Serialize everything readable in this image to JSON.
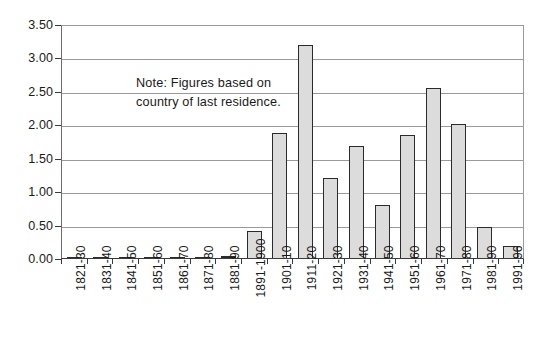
{
  "chart_data": {
    "type": "bar",
    "title": "",
    "subtitle": "",
    "xlabel": "",
    "ylabel": "",
    "ylim": [
      0,
      3.5
    ],
    "grid": true,
    "legend": false,
    "annotation": "Note: Figures based on country of last residence.",
    "annotation_lines": [
      "Note: Figures based on",
      "country of last residence."
    ],
    "y_ticks": [
      "0.00",
      "0.50",
      "1.00",
      "1.50",
      "2.00",
      "2.50",
      "3.00",
      "3.50"
    ],
    "y_tick_values": [
      0.0,
      0.5,
      1.0,
      1.5,
      2.0,
      2.5,
      3.0,
      3.5
    ],
    "categories": [
      "1821-30",
      "1831-40",
      "1841-50",
      "1851-60",
      "1861-70",
      "1871-80",
      "1881-90",
      "1891-1900",
      "1901-10",
      "1911-20",
      "1921-30",
      "1931-40",
      "1941-50",
      "1951-60",
      "1961-70",
      "1971-80",
      "1981-90",
      "1991-96"
    ],
    "values": [
      0.02,
      0.02,
      0.01,
      0.01,
      0.01,
      0.01,
      0.03,
      0.4,
      1.87,
      3.18,
      1.2,
      1.68,
      0.8,
      1.84,
      2.55,
      2.0,
      0.47,
      0.18
    ],
    "series": [
      {
        "name": "Immigration",
        "values": [
          0.02,
          0.02,
          0.01,
          0.01,
          0.01,
          0.01,
          0.03,
          0.4,
          1.87,
          3.18,
          1.2,
          1.68,
          0.8,
          1.84,
          2.55,
          2.0,
          0.47,
          0.18
        ]
      }
    ],
    "colors": {
      "bar_fill": "#dcdcdc",
      "bar_border": "#2b2b2b",
      "gridline": "#9a9a9a",
      "axis": "#3a3a3a",
      "text": "#1a1a1a",
      "background": "#ffffff"
    }
  }
}
